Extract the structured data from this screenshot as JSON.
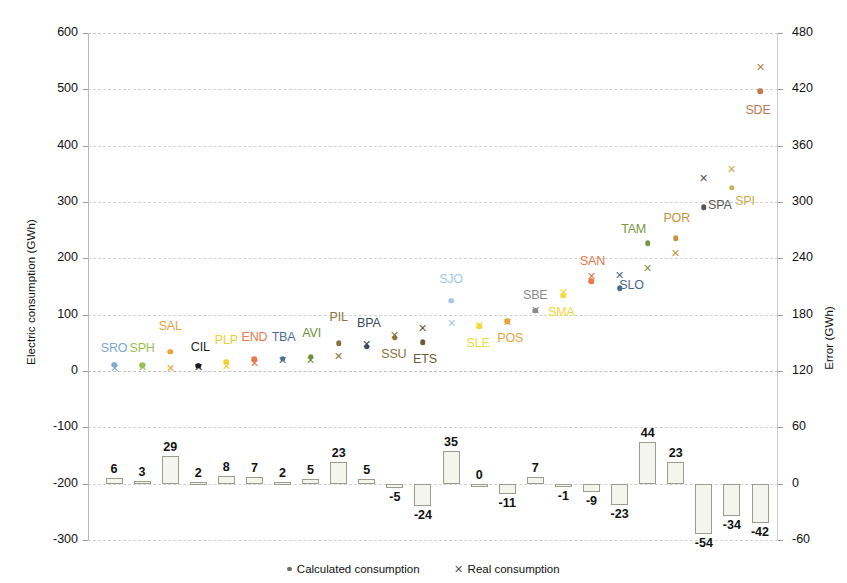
{
  "chart_data": {
    "type": "scatter",
    "title": "",
    "ylabel": "Electric consumption (GWh)",
    "ylabel_right": "Error (GWh)",
    "xlabel": "",
    "ylim": [
      -300,
      600
    ],
    "yticks": [
      600,
      500,
      400,
      300,
      200,
      100,
      0,
      -100,
      -200,
      -300
    ],
    "ylim_right": [
      -60,
      480
    ],
    "yticks_right": [
      480,
      420,
      360,
      300,
      240,
      180,
      120,
      60,
      0,
      -60
    ],
    "grid": true,
    "legend": [
      {
        "label": "Calculated consumption",
        "marker": "dot"
      },
      {
        "label": "Real consumption",
        "marker": "x"
      }
    ],
    "categories": [
      "SRO",
      "SPH",
      "SAL",
      "CIL",
      "PLP",
      "END",
      "TBA",
      "AVI",
      "PIL",
      "BPA",
      "SSU",
      "ETS",
      "SJO",
      "SLE",
      "POS",
      "SBE",
      "SMA",
      "SAN",
      "SLO",
      "TAM",
      "POR",
      "SPA",
      "SPI",
      "SDE"
    ],
    "series": [
      {
        "name": "Calculated consumption",
        "marker": "dot",
        "values": [
          11,
          10,
          34,
          9,
          16,
          21,
          22,
          25,
          49,
          43,
          59,
          51,
          125,
          79,
          88,
          107,
          134,
          159,
          147,
          227,
          236,
          291,
          325,
          497
        ]
      },
      {
        "name": "Real consumption",
        "marker": "x",
        "values": [
          5,
          7,
          5,
          7,
          8,
          14,
          20,
          20,
          26,
          48,
          64,
          76,
          85,
          81,
          87,
          108,
          141,
          168,
          170,
          183,
          210,
          343,
          359,
          539
        ]
      },
      {
        "name": "Error",
        "marker": "bar",
        "axis": "right",
        "values": [
          6,
          3,
          29,
          2,
          8,
          7,
          2,
          5,
          23,
          5,
          -5,
          -24,
          35,
          0,
          -11,
          7,
          -1,
          -9,
          -23,
          44,
          23,
          -54,
          -34,
          -42
        ]
      }
    ],
    "point_colors": {
      "SRO": "#7fa9d4",
      "SPH": "#9bbf55",
      "SAL": "#e8a33d",
      "CIL": "#1c1c1c",
      "PLP": "#f0cf33",
      "END": "#e8794a",
      "TBA": "#4f6f8f",
      "AVI": "#6f8f3a",
      "PIL": "#8b7340",
      "BPA": "#3a4a5a",
      "SSU": "#8b7340",
      "ETS": "#6b5a3a",
      "SJO": "#a8c8e8",
      "SLE": "#f2d93c",
      "POS": "#e8a33d",
      "SBE": "#8a8a8a",
      "SMA": "#f2d93c",
      "SAN": "#e8794a",
      "SLO": "#4a6a8c",
      "TAM": "#7a9440",
      "POR": "#c8913c",
      "SPA": "#555555",
      "SPI": "#c8b050",
      "SDE": "#c07a52"
    },
    "bar_labels": [
      "6",
      "3",
      "29",
      "2",
      "8",
      "7",
      "2",
      "5",
      "23",
      "5",
      "-5",
      "-24",
      "35",
      "0",
      "-11",
      "7",
      "-1",
      "-9",
      "-23",
      "44",
      "23",
      "-54",
      "-34",
      "-42"
    ],
    "colors": {
      "bar_fill": "#f5f5ef",
      "bar_stroke": "#9b9b8e",
      "grid": "#d3d3d3",
      "axis": "#b9b9b9",
      "text": "#111111"
    }
  }
}
